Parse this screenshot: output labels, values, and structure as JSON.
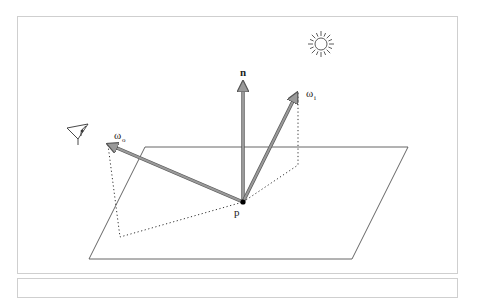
{
  "figure": {
    "labels": {
      "normal": "n",
      "incident": "ω",
      "incident_sub": "i",
      "outgoing": "ω",
      "outgoing_sub": "o",
      "point": "p"
    },
    "icons": [
      "sun-icon",
      "eye-icon"
    ],
    "colors": {
      "arrow": "#9a9a9a",
      "arrow_edge": "#555555",
      "plane": "#555555",
      "dotted": "#333333",
      "frame": "#cfcfcf"
    }
  }
}
